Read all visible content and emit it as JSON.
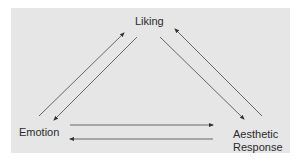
{
  "diagram": {
    "nodes": {
      "liking": "Liking",
      "emotion": "Emotion",
      "aesthetic_line1": "Aesthetic",
      "aesthetic_line2": "Response"
    },
    "edges": [
      {
        "from": "Emotion",
        "to": "Liking"
      },
      {
        "from": "Liking",
        "to": "Emotion"
      },
      {
        "from": "Liking",
        "to": "Aesthetic Response"
      },
      {
        "from": "Aesthetic Response",
        "to": "Liking"
      },
      {
        "from": "Emotion",
        "to": "Aesthetic Response"
      },
      {
        "from": "Aesthetic Response",
        "to": "Emotion"
      }
    ],
    "colors": {
      "background": "#e6e6e6",
      "arrow": "#555555",
      "text": "#2b2b2b"
    }
  }
}
